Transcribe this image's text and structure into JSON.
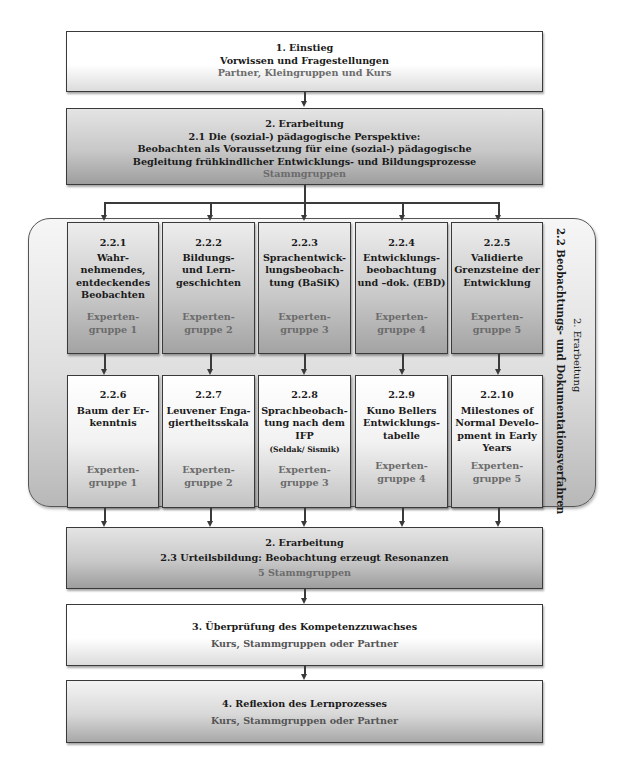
{
  "step1": {
    "title": "1. Einstieg",
    "subtitle": "Vorwissen und Fragestellungen",
    "groups": "Partner, Kleingruppen und Kurs"
  },
  "step2_1": {
    "title": "2. Erarbeitung",
    "heading": "2.1 Die (sozial-) pädagogische Perspektive:",
    "line1": "Beobachten als Voraussetzung für eine (sozial-) pädagogische",
    "line2": "Begleitung frühkindlicher Entwicklungs- und Bildungsprozesse",
    "groups": "Stammgruppen"
  },
  "panel": {
    "label_outer": "2. Erarbeitung",
    "label_inner": "2.2 Beobachtungs- und Dokumentationsverfahren"
  },
  "row1": [
    {
      "num": "2.2.1",
      "lines": [
        "Wahr-",
        "nehmendes,",
        "entdeckendes",
        "Beobachten"
      ],
      "expert": [
        "Experten-",
        "gruppe 1"
      ]
    },
    {
      "num": "2.2.2",
      "lines": [
        "Bildungs-",
        "und Lern-",
        "geschichten"
      ],
      "expert": [
        "Experten-",
        "gruppe 2"
      ]
    },
    {
      "num": "2.2.3",
      "lines": [
        "Sprachentwick-",
        "lungsbeobach-",
        "tung (BaSiK)"
      ],
      "expert": [
        "Experten-",
        "gruppe 3"
      ]
    },
    {
      "num": "2.2.4",
      "lines": [
        "Entwicklungs-",
        "beobachtung",
        "und –dok. (EBD)"
      ],
      "expert": [
        "Experten-",
        "gruppe 4"
      ]
    },
    {
      "num": "2.2.5",
      "lines": [
        "Validierte",
        "Grenzsteine der",
        "Entwicklung"
      ],
      "expert": [
        "Experten-",
        "gruppe 5"
      ]
    }
  ],
  "row2": [
    {
      "num": "2.2.6",
      "lines": [
        "Baum der Er-",
        "kenntnis"
      ],
      "note": "",
      "expert": [
        "Experten-",
        "gruppe 1"
      ]
    },
    {
      "num": "2.2.7",
      "lines": [
        "Leuvener Enga-",
        "giertheitsskala"
      ],
      "note": "",
      "expert": [
        "Experten-",
        "gruppe 2"
      ]
    },
    {
      "num": "2.2.8",
      "lines": [
        "Sprachbeobach-",
        "tung nach dem",
        "IFP"
      ],
      "note": "(Seldak/ Sismik)",
      "expert": [
        "Experten-",
        "gruppe 3"
      ]
    },
    {
      "num": "2.2.9",
      "lines": [
        "Kuno Bellers",
        "Entwicklungs-",
        "tabelle"
      ],
      "note": "",
      "expert": [
        "Experten-",
        "gruppe 4"
      ]
    },
    {
      "num": "2.2.10",
      "lines": [
        "Milestones of",
        "Normal Develo-",
        "pment in  Early",
        "Years"
      ],
      "note": "",
      "expert": [
        "Experten-",
        "gruppe 5"
      ]
    }
  ],
  "step2_3": {
    "title": "2. Erarbeitung",
    "heading": "2.3 Urteilsbildung: Beobachtung erzeugt Resonanzen",
    "groups": "5 Stammgruppen"
  },
  "step3": {
    "title": "3. Überprüfung des Kompetenzzuwachses",
    "groups": "Kurs, Stammgruppen oder Partner"
  },
  "step4": {
    "title": "4. Reflexion des Lernprozesses",
    "groups": "Kurs, Stammgruppen oder Partner"
  }
}
